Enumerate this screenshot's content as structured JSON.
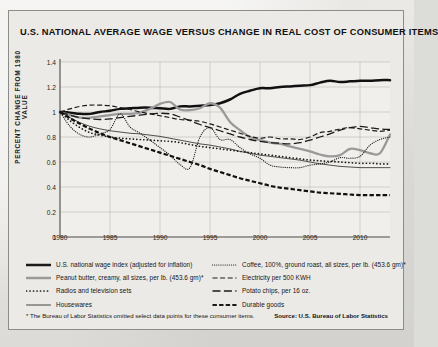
{
  "chart_data": {
    "type": "line",
    "title": "U.S. NATIONAL AVERAGE WAGE VERSUS CHANGE IN REAL COST OF CONSUMER ITEMS",
    "xlabel": "",
    "ylabel": "PERCENT CHANGE FROM 1980 VALUE",
    "xlim": [
      1980,
      2013
    ],
    "ylim": [
      0,
      1.4
    ],
    "ytick_labels": [
      "0",
      "0.2",
      "0.4",
      "0.6",
      "0.8",
      "1",
      "1.2",
      "1.4"
    ],
    "ytick_values": [
      0,
      0.2,
      0.4,
      0.6,
      0.8,
      1.0,
      1.2,
      1.4
    ],
    "xtick_labels": [
      "1980",
      "1985",
      "1990",
      "1995",
      "2000",
      "2005",
      "2010"
    ],
    "xtick_values": [
      1980,
      1985,
      1990,
      1995,
      2000,
      2005,
      2010
    ],
    "grid": true,
    "legend_position": "below",
    "x": [
      1980,
      1981,
      1982,
      1983,
      1984,
      1985,
      1986,
      1987,
      1988,
      1989,
      1990,
      1991,
      1992,
      1993,
      1994,
      1995,
      1996,
      1997,
      1998,
      1999,
      2000,
      2001,
      2002,
      2003,
      2004,
      2005,
      2006,
      2007,
      2008,
      2009,
      2010,
      2011,
      2012,
      2013
    ],
    "series": [
      {
        "name": "U.S. national wage index (adjusted for inflation)",
        "style": "solid-thick-black",
        "color": "#111111",
        "values": [
          1.0,
          0.995,
          0.985,
          0.985,
          1.0,
          1.01,
          1.025,
          1.03,
          1.035,
          1.035,
          1.03,
          1.025,
          1.045,
          1.045,
          1.05,
          1.055,
          1.07,
          1.1,
          1.145,
          1.17,
          1.19,
          1.19,
          1.2,
          1.205,
          1.21,
          1.215,
          1.235,
          1.25,
          1.24,
          1.245,
          1.25,
          1.25,
          1.255,
          1.255
        ]
      },
      {
        "name": "Peanut butter, creamy, all sizes, per lb. (453.6 gm)*",
        "style": "solid-thick-gray",
        "color": "#9a9a9a",
        "values": [
          1.0,
          0.975,
          0.955,
          0.955,
          0.965,
          0.975,
          0.985,
          0.985,
          0.995,
          1.025,
          1.065,
          1.08,
          1.02,
          1.015,
          1.03,
          1.07,
          1.035,
          0.92,
          0.855,
          0.8,
          0.775,
          0.755,
          0.745,
          0.725,
          0.705,
          0.685,
          0.66,
          0.645,
          0.655,
          0.705,
          0.695,
          0.67,
          0.67,
          0.82
        ]
      },
      {
        "name": "Radios and television sets",
        "style": "dotted-round-black",
        "color": "#1a1a1a",
        "values": [
          1.0,
          0.93,
          0.875,
          0.835,
          0.815,
          0.8,
          0.79,
          0.785,
          0.78,
          0.775,
          0.77,
          0.765,
          0.755,
          0.74,
          0.725,
          0.715,
          0.705,
          0.695,
          0.685,
          0.675,
          0.665,
          0.655,
          0.645,
          0.635,
          0.625,
          0.615,
          0.61,
          0.605,
          0.6,
          0.595,
          0.59,
          0.59,
          0.585,
          0.585
        ]
      },
      {
        "name": "Housewares",
        "style": "solid-thin-black",
        "color": "#262626",
        "values": [
          1.0,
          0.955,
          0.915,
          0.885,
          0.865,
          0.85,
          0.84,
          0.83,
          0.825,
          0.815,
          0.805,
          0.79,
          0.775,
          0.76,
          0.745,
          0.735,
          0.72,
          0.705,
          0.685,
          0.67,
          0.655,
          0.645,
          0.635,
          0.625,
          0.615,
          0.6,
          0.585,
          0.575,
          0.565,
          0.56,
          0.555,
          0.555,
          0.555,
          0.555
        ]
      },
      {
        "name": "Coffee, 100%, ground roast, all sizes, per lb. (453.6 gm)*",
        "style": "dotted-fine-black",
        "color": "#1a1a1a",
        "values": [
          1.0,
          0.885,
          0.82,
          0.8,
          0.825,
          0.86,
          0.985,
          0.88,
          0.83,
          0.775,
          0.715,
          0.655,
          0.58,
          0.555,
          0.8,
          0.875,
          0.78,
          0.78,
          0.715,
          0.665,
          0.63,
          0.575,
          0.56,
          0.555,
          0.555,
          0.575,
          0.585,
          0.6,
          0.635,
          0.63,
          0.645,
          0.735,
          0.78,
          0.8
        ]
      },
      {
        "name": "Electricity per 500 KWH",
        "style": "dashed-medium-black",
        "color": "#1a1a1a",
        "values": [
          1.0,
          1.025,
          1.045,
          1.055,
          1.055,
          1.05,
          1.035,
          1.02,
          1.0,
          0.985,
          0.97,
          0.955,
          0.94,
          0.935,
          0.925,
          0.905,
          0.88,
          0.855,
          0.83,
          0.805,
          0.79,
          0.8,
          0.785,
          0.785,
          0.78,
          0.8,
          0.835,
          0.845,
          0.865,
          0.875,
          0.865,
          0.855,
          0.845,
          0.855
        ]
      },
      {
        "name": "Potato chips, per 16 oz.",
        "style": "dashed-long-black",
        "color": "#1a1a1a",
        "values": [
          1.0,
          0.975,
          0.955,
          0.945,
          0.94,
          0.945,
          0.955,
          0.965,
          0.975,
          0.985,
          0.99,
          0.985,
          0.96,
          0.93,
          0.9,
          0.875,
          0.85,
          0.825,
          0.8,
          0.78,
          0.765,
          0.755,
          0.75,
          0.745,
          0.755,
          0.775,
          0.8,
          0.825,
          0.855,
          0.875,
          0.885,
          0.875,
          0.865,
          0.86
        ]
      },
      {
        "name": "Durable goods",
        "style": "dashed-heavy-black",
        "color": "#111111",
        "values": [
          1.0,
          0.95,
          0.905,
          0.865,
          0.83,
          0.8,
          0.775,
          0.75,
          0.725,
          0.7,
          0.675,
          0.65,
          0.625,
          0.6,
          0.575,
          0.545,
          0.52,
          0.495,
          0.47,
          0.45,
          0.43,
          0.41,
          0.395,
          0.385,
          0.375,
          0.365,
          0.355,
          0.35,
          0.345,
          0.34,
          0.335,
          0.335,
          0.335,
          0.335
        ]
      }
    ]
  },
  "legend": {
    "items": [
      {
        "label": "U.S. national wage index (adjusted for inflation)",
        "style": "solid-thick-black",
        "column": "left"
      },
      {
        "label": "Peanut butter, creamy, all sizes, per lb. (453.6 gm)*",
        "style": "solid-thick-gray",
        "column": "left"
      },
      {
        "label": "Radios and television sets",
        "style": "dotted-round-black",
        "column": "left"
      },
      {
        "label": "Housewares",
        "style": "solid-thin-black",
        "column": "left"
      },
      {
        "label": "Coffee, 100%, ground roast, all sizes, per lb. (453.6 gm)*",
        "style": "dotted-fine-black",
        "column": "right"
      },
      {
        "label": "Electricity per 500 KWH",
        "style": "dashed-medium-black",
        "column": "right"
      },
      {
        "label": "Potato chips, per 16 oz.",
        "style": "dashed-long-black",
        "column": "right"
      },
      {
        "label": "Durable goods",
        "style": "dashed-heavy-black",
        "column": "right"
      }
    ]
  },
  "footnote": "* The Bureau of Labor Statistics omitted select data points for these consumer items.",
  "source": "Source: U.S. Bureau of Labor Statistics",
  "colors": {
    "background": "#e3e2de",
    "panel": "#eceae6",
    "frame_border": "#8d8d88",
    "grid": "#b9b8b3",
    "axis": "#4a4a48",
    "wage_line": "#111111",
    "peanut_butter_line": "#9a9a9a"
  }
}
